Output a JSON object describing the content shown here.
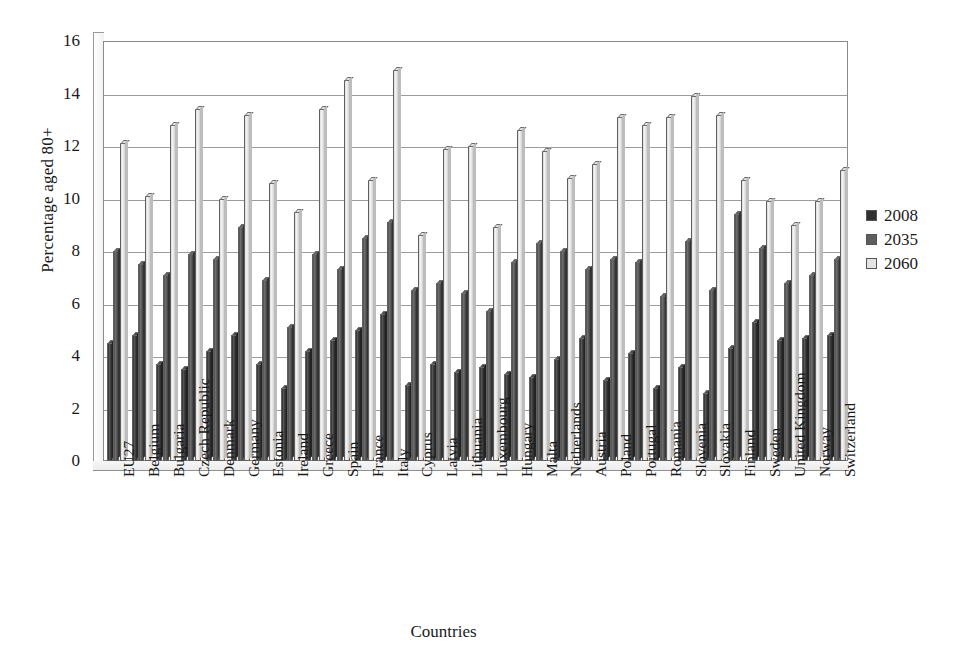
{
  "chart_data": {
    "type": "bar",
    "title": "",
    "xlabel": "Countries",
    "ylabel": "Percentage aged 80+",
    "ylim": [
      0,
      16
    ],
    "yticks": [
      0,
      2,
      4,
      6,
      8,
      10,
      12,
      14,
      16
    ],
    "grid": true,
    "legend_position": "right",
    "categories": [
      "EU27",
      "Belgium",
      "Bulgaria",
      "Czech Republic",
      "Denmark",
      "Germany",
      "Estonia",
      "Ireland",
      "Greece",
      "Spain",
      "France",
      "Italy",
      "Cyprus",
      "Latvia",
      "Lithuania",
      "Luxembourg",
      "Hungary",
      "Malta",
      "Netherlands",
      "Austria",
      "Poland",
      "Portugal",
      "Romania",
      "Slovenia",
      "Slovakia",
      "Finland",
      "Sweden",
      "United Kingdom",
      "Norway",
      "Switzerland"
    ],
    "series": [
      {
        "name": "2008",
        "color": "#303030",
        "values": [
          4.5,
          4.8,
          3.7,
          3.5,
          4.2,
          4.8,
          3.7,
          2.8,
          4.2,
          4.6,
          5.0,
          5.6,
          2.9,
          3.7,
          3.4,
          3.6,
          3.3,
          3.2,
          3.9,
          4.7,
          3.1,
          4.1,
          2.8,
          3.6,
          2.6,
          4.3,
          5.3,
          4.6,
          4.7,
          4.8
        ]
      },
      {
        "name": "2035",
        "color": "#5e5e5e",
        "values": [
          8.0,
          7.5,
          7.1,
          7.9,
          7.7,
          8.9,
          6.9,
          5.1,
          7.9,
          7.3,
          8.5,
          9.1,
          6.5,
          6.8,
          6.4,
          5.7,
          7.6,
          8.3,
          8.0,
          7.3,
          7.7,
          7.6,
          6.3,
          8.4,
          6.5,
          9.4,
          8.1,
          6.8,
          7.1,
          7.7
        ]
      },
      {
        "name": "2060",
        "color": "#e4e4e4",
        "values": [
          12.1,
          10.1,
          12.8,
          13.4,
          10.0,
          13.2,
          10.6,
          9.5,
          13.4,
          14.5,
          10.7,
          14.9,
          8.6,
          11.9,
          12.0,
          8.9,
          12.6,
          11.8,
          10.8,
          11.3,
          13.1,
          12.8,
          13.1,
          13.9,
          13.2,
          10.7,
          9.9,
          9.0,
          9.9,
          11.1
        ]
      }
    ]
  },
  "legend": {
    "items": [
      {
        "label": "2008"
      },
      {
        "label": "2035"
      },
      {
        "label": "2060"
      }
    ]
  },
  "axes": {
    "y_title": "Percentage aged 80+",
    "x_title": "Countries"
  }
}
